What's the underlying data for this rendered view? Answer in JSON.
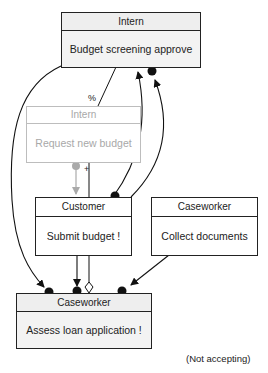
{
  "diagram": {
    "nodes": [
      {
        "id": "n1",
        "role": "Intern",
        "task": "Budget screening approve",
        "state": "active"
      },
      {
        "id": "n2",
        "role": "Intern",
        "task": "Request new budget",
        "state": "inactive"
      },
      {
        "id": "n3",
        "role": "Customer",
        "task": "Submit budget  !",
        "state": "active"
      },
      {
        "id": "n4",
        "role": "Caseworker",
        "task": "Collect documents",
        "state": "active"
      },
      {
        "id": "n5",
        "role": "Caseworker",
        "task": "Assess loan application  !",
        "state": "active"
      }
    ],
    "edge_labels": {
      "percent": "%",
      "plus": "+"
    },
    "status": "(Not accepting)",
    "colors": {
      "line": "#111111",
      "inactive_line": "#aaaaaa",
      "box_fill": "#f3f3f3"
    }
  }
}
